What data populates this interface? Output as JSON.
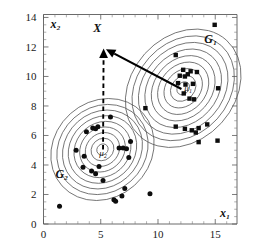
{
  "chart_data": {
    "type": "scatter",
    "title": "",
    "xlabel": "x₁",
    "ylabel": "x₂",
    "xlim": [
      0,
      16.9
    ],
    "ylim": [
      0,
      14.2
    ],
    "xticks": [
      0,
      5,
      10,
      15
    ],
    "xtick_labels": [
      "0",
      "5",
      "10",
      "15"
    ],
    "yticks": [
      0,
      2,
      4,
      6,
      8,
      10,
      12,
      14
    ],
    "ytick_labels": [
      "0",
      "2",
      "4",
      "6",
      "8",
      "10",
      "12",
      "14"
    ],
    "grid": false,
    "legend": "none",
    "annotations": [
      {
        "name": "G1",
        "text": "G₁",
        "x": 14.6,
        "y": 12.3
      },
      {
        "name": "G2",
        "text": "G₂",
        "x": 1.6,
        "y": 3.1
      },
      {
        "name": "X",
        "text": "X",
        "x": 4.7,
        "y": 13.0
      },
      {
        "name": "mu1",
        "text": "μ₁",
        "x": 12.3,
        "y": 9.0
      },
      {
        "name": "mu2",
        "text": "μ₂",
        "x": 5.2,
        "y": 4.6
      }
    ],
    "arrows": [
      {
        "name": "mu1-to-X",
        "style": "solid",
        "from": [
          12.05,
          9.15
        ],
        "to": [
          5.45,
          11.85
        ]
      },
      {
        "name": "mu2-to-X",
        "style": "dashed",
        "from": [
          5.2,
          5.05
        ],
        "to": [
          5.25,
          11.9
        ]
      }
    ],
    "series": [
      {
        "name": "G₁",
        "marker": "square",
        "center": [
          12.2,
          9.2
        ],
        "points": [
          [
            14.95,
            13.5
          ],
          [
            11.55,
            11.45
          ],
          [
            8.9,
            7.85
          ],
          [
            12.2,
            10.45
          ],
          [
            12.85,
            10.35
          ],
          [
            13.4,
            10.3
          ],
          [
            11.9,
            10.05
          ],
          [
            12.35,
            10.0
          ],
          [
            12.6,
            10.15
          ],
          [
            11.75,
            9.55
          ],
          [
            12.4,
            9.45
          ],
          [
            13.05,
            9.5
          ],
          [
            12.25,
            8.85
          ],
          [
            12.75,
            8.5
          ],
          [
            13.15,
            8.45
          ],
          [
            15.25,
            9.2
          ],
          [
            14.3,
            6.75
          ],
          [
            13.55,
            6.5
          ],
          [
            12.95,
            6.35
          ],
          [
            12.35,
            6.45
          ],
          [
            11.55,
            6.6
          ],
          [
            13.3,
            6.2
          ],
          [
            15.2,
            5.65
          ],
          [
            13.55,
            5.55
          ]
        ]
      },
      {
        "name": "G₂",
        "marker": "circle",
        "center": [
          5.15,
          5.05
        ],
        "points": [
          [
            1.4,
            1.2
          ],
          [
            2.85,
            5.0
          ],
          [
            3.55,
            4.6
          ],
          [
            3.75,
            6.25
          ],
          [
            4.3,
            6.5
          ],
          [
            4.55,
            6.45
          ],
          [
            4.75,
            6.6
          ],
          [
            5.85,
            7.25
          ],
          [
            3.45,
            3.85
          ],
          [
            4.2,
            3.6
          ],
          [
            4.55,
            3.4
          ],
          [
            4.85,
            3.9
          ],
          [
            5.2,
            2.95
          ],
          [
            6.15,
            1.65
          ],
          [
            6.3,
            1.55
          ],
          [
            6.85,
            1.9
          ],
          [
            7.1,
            2.4
          ],
          [
            7.45,
            4.5
          ],
          [
            6.6,
            5.15
          ],
          [
            6.95,
            5.15
          ],
          [
            7.25,
            5.1
          ],
          [
            7.6,
            5.6
          ],
          [
            9.3,
            2.05
          ]
        ]
      }
    ],
    "contours": [
      {
        "group": "G₁",
        "center": [
          12.2,
          9.2
        ],
        "angle_deg": -48,
        "levels": [
          [
            0.62,
            0.38
          ],
          [
            1.25,
            0.77
          ],
          [
            1.88,
            1.16
          ],
          [
            2.5,
            1.55
          ],
          [
            3.12,
            1.93
          ],
          [
            3.75,
            2.32
          ],
          [
            4.38,
            2.71
          ],
          [
            5.0,
            3.1
          ],
          [
            5.65,
            3.5
          ]
        ]
      },
      {
        "group": "G₂",
        "center": [
          5.15,
          5.05
        ],
        "angle_deg": -42,
        "levels": [
          [
            0.52,
            0.36
          ],
          [
            1.05,
            0.72
          ],
          [
            1.58,
            1.08
          ],
          [
            2.1,
            1.44
          ],
          [
            2.62,
            1.8
          ],
          [
            3.15,
            2.16
          ],
          [
            3.68,
            2.52
          ],
          [
            4.2,
            2.88
          ],
          [
            4.75,
            3.26
          ]
        ]
      }
    ]
  }
}
